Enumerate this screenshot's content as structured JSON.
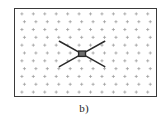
{
  "figure": {
    "caption": "b)",
    "frame": {
      "x": 14,
      "y": 8,
      "width": 143,
      "height": 89,
      "border_color": "#3a3a3a",
      "background_color": "#ffffff"
    }
  },
  "chart_data": {
    "type": "scatter",
    "title": "",
    "subtitle": "",
    "xlabel": "",
    "ylabel": "",
    "annotation": "b)",
    "grid": true,
    "legend": null,
    "xlim": [
      0,
      143
    ],
    "ylim": [
      0,
      89
    ],
    "xticks": [],
    "yticks": [],
    "marker_style": "plus",
    "marker_color": "#9a9a9a",
    "marker_size": 3.2,
    "grid_cols": 12,
    "grid_rows": 11,
    "grid_x_start": 7,
    "grid_y_start": 5,
    "grid_x_step": 11.6,
    "grid_y_step": 8.0,
    "grid_row_offset": 2.6,
    "series": [
      {
        "name": "marker-field",
        "description": "regular lattice of small plus markers filling the frame"
      },
      {
        "name": "defect",
        "description": "dark four-armed X-shaped feature with square hub",
        "color": "#2a2a2a",
        "hub": {
          "cx": 68,
          "cy": 46,
          "size": 7
        },
        "arms": [
          {
            "x1": 68,
            "y1": 46,
            "x2": 45,
            "y2": 33
          },
          {
            "x1": 68,
            "y1": 46,
            "x2": 91,
            "y2": 33
          },
          {
            "x1": 68,
            "y1": 46,
            "x2": 45,
            "y2": 59
          },
          {
            "x1": 68,
            "y1": 46,
            "x2": 91,
            "y2": 59
          }
        ]
      }
    ]
  }
}
